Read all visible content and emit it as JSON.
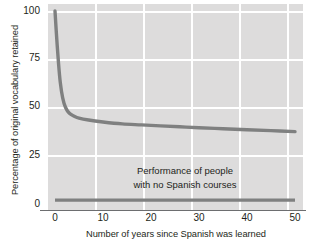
{
  "chart_data": {
    "type": "line",
    "title": "",
    "subtitle": "",
    "xlabel": "Number of years since Spanish was learned",
    "ylabel": "Percentage of original vocabulary retained",
    "xlim": [
      0,
      50
    ],
    "ylim": [
      0,
      100
    ],
    "xticks": [
      0,
      10,
      20,
      30,
      40,
      50
    ],
    "xtick_labels": [
      "0",
      "10",
      "20",
      "30",
      "40",
      "50"
    ],
    "yticks": [
      0,
      25,
      50,
      75,
      100
    ],
    "ytick_labels": [
      "0",
      "25",
      "50",
      "75",
      "100"
    ],
    "grid": true,
    "grid_color": "#ffffff",
    "plot_background": "#dddcdc",
    "legend_position": "none",
    "annotations": [
      {
        "name": "no-courses-label",
        "line1": "Performance of people",
        "line2": "with no Spanish courses",
        "x": 25,
        "y": 12
      }
    ],
    "series": [
      {
        "name": "Vocabulary retained after Spanish courses",
        "color": "#7f8080",
        "x": [
          0,
          0.3,
          0.7,
          1.1,
          1.6,
          2.2,
          3,
          4,
          5,
          7,
          10,
          14,
          18,
          22,
          26,
          30,
          35,
          40,
          45,
          50
        ],
        "y": [
          100,
          88,
          74,
          63,
          55,
          50,
          47,
          45.5,
          44.5,
          43.5,
          42.5,
          41.5,
          41,
          40.5,
          40,
          39.5,
          39,
          38.5,
          38,
          37.5
        ]
      },
      {
        "name": "Performance of people with no Spanish courses",
        "color": "#7f8080",
        "x": [
          0,
          10,
          20,
          30,
          40,
          50
        ],
        "y": [
          2,
          2,
          2,
          2,
          2,
          2
        ]
      }
    ]
  }
}
